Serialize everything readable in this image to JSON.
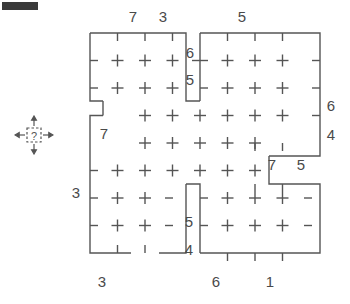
{
  "page": {
    "width": 350,
    "height": 304,
    "background": "#ffffff",
    "ink_color": "#4a4a4a",
    "marker_color": "#3a3a3a"
  },
  "corner_marker": {
    "name": "top-left-black-bar",
    "color": "#3a3a3a",
    "x": 2,
    "y": 2,
    "w": 36,
    "h": 8
  },
  "cursor_icon": {
    "name": "move-resize-question-cursor",
    "glyph": "?",
    "description": "four-direction arrows around dashed square containing question mark",
    "x": 14,
    "y": 115,
    "size": 40
  },
  "grid": {
    "origin_x": 90,
    "origin_y": 33,
    "cell": 27.5,
    "cols": 8,
    "rows": 8,
    "cross_arm": 6,
    "tick_len": 6,
    "stroke": "#555555",
    "stroke_width": 1.4
  },
  "chart_data": {
    "type": "table",
    "title": "",
    "labels": [
      {
        "id": "top-1",
        "text": "7",
        "x": 133,
        "y": 16,
        "side": "top",
        "edge_cells": 7
      },
      {
        "id": "top-2",
        "text": "3",
        "x": 163,
        "y": 16,
        "side": "top",
        "edge_cells": 3
      },
      {
        "id": "top-3",
        "text": "5",
        "x": 242,
        "y": 16,
        "side": "top",
        "edge_cells": 5
      },
      {
        "id": "inner-1",
        "text": "6",
        "x": 190,
        "y": 52,
        "side": "inner",
        "edge_cells": 6
      },
      {
        "id": "inner-2",
        "text": "5",
        "x": 190,
        "y": 79,
        "side": "inner",
        "edge_cells": 5
      },
      {
        "id": "right-1",
        "text": "6",
        "x": 331,
        "y": 105,
        "side": "right",
        "edge_cells": 6
      },
      {
        "id": "right-2",
        "text": "4",
        "x": 331,
        "y": 134,
        "side": "right",
        "edge_cells": 4
      },
      {
        "id": "inner-3",
        "text": "7",
        "x": 104,
        "y": 133,
        "side": "inner",
        "edge_cells": 7
      },
      {
        "id": "inner-4",
        "text": "7",
        "x": 272,
        "y": 164,
        "side": "inner",
        "edge_cells": 7
      },
      {
        "id": "inner-5",
        "text": "5",
        "x": 301,
        "y": 164,
        "side": "inner",
        "edge_cells": 5
      },
      {
        "id": "left-1",
        "text": "3",
        "x": 76,
        "y": 192,
        "side": "left",
        "edge_cells": 3
      },
      {
        "id": "inner-6",
        "text": "5",
        "x": 189,
        "y": 221,
        "side": "inner",
        "edge_cells": 5
      },
      {
        "id": "inner-7",
        "text": "4",
        "x": 189,
        "y": 249,
        "side": "inner",
        "edge_cells": 4
      },
      {
        "id": "bottom-1",
        "text": "3",
        "x": 102,
        "y": 281,
        "side": "bottom",
        "edge_cells": 3
      },
      {
        "id": "bottom-2",
        "text": "6",
        "x": 216,
        "y": 281,
        "side": "bottom",
        "edge_cells": 6
      },
      {
        "id": "bottom-3",
        "text": "1",
        "x": 270,
        "y": 281,
        "side": "bottom",
        "edge_cells": 1
      }
    ],
    "boundary_segments": [
      "top-left block outline from col0 to col4 at row0",
      "step down at col4 between row1 and row2",
      "notch at col0-col1 between row2 and row3",
      "right block outline from col4 to col8 at row0",
      "right edge down to row4 then step in at col7",
      "lower-right block from col4 to col8 between row5 and row8",
      "lower-left block from col0 to col4 between row3 and row8",
      "bottom gap at col1-col2"
    ]
  }
}
